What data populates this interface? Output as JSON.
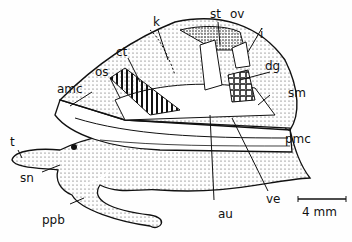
{
  "figure": {
    "labels": [
      {
        "id": "st",
        "text": "st"
      },
      {
        "id": "ov",
        "text": "ov"
      },
      {
        "id": "k",
        "text": "k"
      },
      {
        "id": "i",
        "text": "i"
      },
      {
        "id": "ct",
        "text": "ct"
      },
      {
        "id": "dg",
        "text": "dg"
      },
      {
        "id": "os",
        "text": "os"
      },
      {
        "id": "amc",
        "text": "amc"
      },
      {
        "id": "sm",
        "text": "sm"
      },
      {
        "id": "pmc",
        "text": "pmc"
      },
      {
        "id": "t",
        "text": "t"
      },
      {
        "id": "sn",
        "text": "sn"
      },
      {
        "id": "ppb",
        "text": "ppb"
      },
      {
        "id": "au",
        "text": "au"
      },
      {
        "id": "ve",
        "text": "ve"
      }
    ],
    "scale_bar": {
      "text": "4 mm"
    }
  }
}
